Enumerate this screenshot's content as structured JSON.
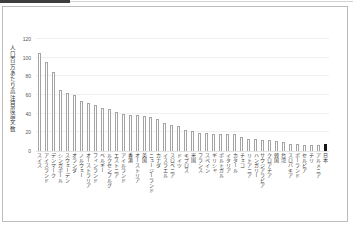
{
  "chart_data": {
    "type": "bar",
    "title": "",
    "ylabel": "人口百万あたり高注目度論文数",
    "xlabel": "",
    "ylim": [
      0,
      120
    ],
    "yticks": [
      0,
      20,
      40,
      60,
      80,
      100,
      120
    ],
    "grid": "faint-horizontal",
    "legend": "none",
    "bar_style": {
      "normal_fill": "#ffffff",
      "normal_outline": "#a4a4a4",
      "highlight_fill": "#141414"
    },
    "highlight_index": 41,
    "highlight_category": "日本",
    "categories": [
      "スイス",
      "アイスランド",
      "デンマーク",
      "シンガポール",
      "スウェーデン",
      "オランダ",
      "ノルウェー",
      "オーストラリア",
      "フィンランド",
      "ベルギー",
      "ルクセンブルグ",
      "エストニア",
      "アイルランド",
      "香港",
      "オーストリア",
      "英国",
      "ニュージーランド",
      "カナダ",
      "イスラエル",
      "スロベニア",
      "ドイツ",
      "キプロス",
      "米国",
      "フランス",
      "スペイン",
      "ギリシャ",
      "ポルトガル",
      "イタリア",
      "カタール",
      "チェコ",
      "リトアニア",
      "ハンガリー",
      "サウジアラビア",
      "クロアチア",
      "韓国",
      "台湾",
      "スロバキア",
      "ポーランド",
      "セルビア",
      "チリ",
      "アルメニア",
      "日本"
    ],
    "values": [
      105,
      95,
      85,
      65,
      62,
      60,
      54,
      51,
      49,
      46,
      45,
      42,
      39.5,
      38.5,
      38.5,
      37.5,
      36,
      34.5,
      30.5,
      28,
      26.5,
      23,
      22,
      19.5,
      19.2,
      18.8,
      18.8,
      18.2,
      17.8,
      15,
      13.2,
      12.6,
      12.2,
      11.6,
      11.2,
      9.6,
      7.4,
      7.1,
      6.8,
      6.4,
      6.1,
      8
    ]
  }
}
